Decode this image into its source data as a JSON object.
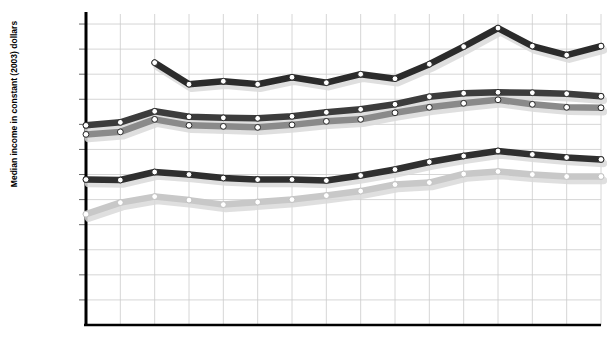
{
  "chart_data": {
    "type": "line",
    "title": "",
    "xlabel": "",
    "ylabel": "Median income in constant (2003) dollars",
    "x": [
      1980,
      1985,
      1990,
      1991,
      1992,
      1993,
      1994,
      1995,
      1996,
      1997,
      1998,
      1999,
      2000,
      2001,
      2002,
      2003
    ],
    "xticklabels": [
      "1980",
      "1985",
      "1990",
      "1991",
      "1992",
      "1993",
      "1994",
      "1995",
      "1996",
      "1997",
      "1998",
      "1999",
      "2000",
      "2001",
      "2002",
      "2003"
    ],
    "yticklabels": [
      "$60,000",
      "$55,000",
      "$50,000",
      "$45,000",
      "$40,000",
      "$35,000",
      "$30,000",
      "$25,000",
      "$20,000",
      "$25,000",
      "$10,000",
      "$5,000"
    ],
    "ytickvalues": [
      60000,
      55000,
      50000,
      45000,
      40000,
      35000,
      30000,
      25000,
      20000,
      15000,
      10000,
      5000
    ],
    "ylim": [
      0,
      62000
    ],
    "grid": true,
    "legend_position": "inline-labels",
    "series": [
      {
        "name": "Asian, Pacific Islander",
        "color": "#2b2b2b",
        "x": [
          1990,
          1991,
          1992,
          1993,
          1994,
          1995,
          1996,
          1997,
          1998,
          1999,
          2000,
          2001,
          2002,
          2003
        ],
        "values": [
          52300,
          48000,
          48600,
          48000,
          49400,
          48300,
          50000,
          49100,
          52000,
          55500,
          59200,
          55600,
          53800,
          55600
        ]
      },
      {
        "name": "White",
        "color": "#3c3c3c",
        "x": [
          1980,
          1985,
          1990,
          1991,
          1992,
          1993,
          1994,
          1995,
          1996,
          1997,
          1998,
          1999,
          2000,
          2001,
          2002,
          2003
        ],
        "values": [
          39800,
          40400,
          42600,
          41500,
          41300,
          41200,
          41600,
          42400,
          43000,
          44000,
          45500,
          46200,
          46400,
          46300,
          46100,
          45600
        ]
      },
      {
        "name": "All households",
        "color": "#8a8a8a",
        "x": [
          1980,
          1985,
          1990,
          1991,
          1992,
          1993,
          1994,
          1995,
          1996,
          1997,
          1998,
          1999,
          2000,
          2001,
          2002,
          2003
        ],
        "values": [
          38000,
          38500,
          41000,
          39800,
          39600,
          39400,
          39900,
          40600,
          41000,
          42300,
          43400,
          44200,
          44900,
          44000,
          43400,
          43300
        ]
      },
      {
        "name": "Hispanic",
        "color": "#2f2f2f",
        "x": [
          1980,
          1985,
          1990,
          1991,
          1992,
          1993,
          1994,
          1995,
          1996,
          1997,
          1998,
          1999,
          2000,
          2001,
          2002,
          2003
        ],
        "values": [
          29000,
          28900,
          30500,
          30000,
          29300,
          29000,
          29000,
          28800,
          29800,
          31000,
          32500,
          33700,
          34700,
          34000,
          33400,
          33000
        ]
      },
      {
        "name": "Black",
        "color": "#c8c8c8",
        "x": [
          1980,
          1985,
          1990,
          1991,
          1992,
          1993,
          1994,
          1995,
          1996,
          1997,
          1998,
          1999,
          2000,
          2001,
          2002,
          2003
        ],
        "values": [
          22100,
          24400,
          25600,
          24900,
          24000,
          24500,
          25000,
          25800,
          26700,
          28000,
          28400,
          30100,
          30600,
          30000,
          29600,
          29600
        ]
      }
    ],
    "series_label_positions": [
      {
        "name": "Asian, Pacific Islander",
        "x": 316,
        "y": 33
      },
      {
        "name": "White",
        "x": 509,
        "y": 73
      },
      {
        "name": "All households",
        "x": 429,
        "y": 121
      },
      {
        "name": "Hispanic",
        "x": 388,
        "y": 142
      },
      {
        "name": "Black",
        "x": 110,
        "y": 216
      }
    ]
  }
}
